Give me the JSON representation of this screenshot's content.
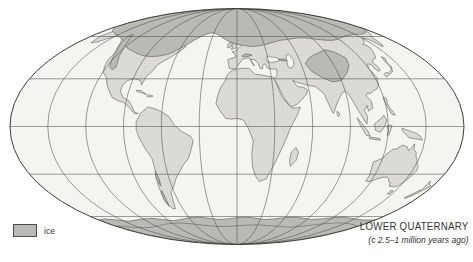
{
  "figure": {
    "caption_title": "LOWER QUATERNARY",
    "caption_subtitle": "(c 2.5–1 million years ago)",
    "legend_label": "ice"
  },
  "colors": {
    "background": "#ffffff",
    "ocean": "#f4f4f1",
    "land": "#dcdbd5",
    "land_stipple": "#b8b7ae",
    "ice": "#b9bab3",
    "ice_outline": "#686863",
    "coastline": "#55554f",
    "graticule": "#4e4e49",
    "map_outline": "#3e3e3a",
    "text": "#343431"
  },
  "map": {
    "projection": "mollweide-oval",
    "graticule_parallels_deg": [
      -60,
      -30,
      0,
      30,
      60
    ],
    "graticule_meridian_step_deg": 30,
    "ice_regions_depicted": [
      "Arctic Ocean & Greenland cap",
      "Laurentide (northern North America)",
      "Scandinavian & northwest Eurasia",
      "Siberian highlands",
      "Central Asia / Tibetan plateau",
      "Alps",
      "Western North America cordillera",
      "Andes",
      "Antarctica"
    ]
  }
}
